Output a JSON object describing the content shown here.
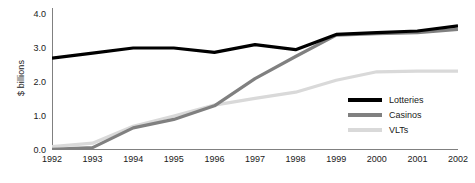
{
  "chart_data": {
    "type": "line",
    "title": "",
    "xlabel": "",
    "ylabel": "$ billions",
    "categories": [
      "1992",
      "1993",
      "1994",
      "1995",
      "1996",
      "1997",
      "1998",
      "1999",
      "2000",
      "2001",
      "2002"
    ],
    "x": [
      1992,
      1993,
      1994,
      1995,
      1996,
      1997,
      1998,
      1999,
      2000,
      2001,
      2002
    ],
    "xlim": [
      1992,
      2002
    ],
    "ylim": [
      0.0,
      4.0
    ],
    "yticks": [
      0.0,
      1.0,
      2.0,
      3.0,
      4.0
    ],
    "ytick_labels": [
      "0.0",
      "1.0",
      "2.0",
      "3.0",
      "4.0"
    ],
    "grid": false,
    "legend_position": "lower-right",
    "series": [
      {
        "name": "Lotteries",
        "color": "#000000",
        "width": 3.2,
        "values": [
          2.7,
          2.85,
          3.0,
          3.0,
          2.87,
          3.1,
          2.95,
          3.4,
          3.45,
          3.5,
          3.65
        ]
      },
      {
        "name": "Casinos",
        "color": "#808080",
        "width": 3.2,
        "values": [
          0.02,
          0.07,
          0.65,
          0.9,
          1.3,
          2.1,
          2.75,
          3.38,
          3.42,
          3.45,
          3.55
        ]
      },
      {
        "name": "VLTs",
        "color": "#d9d9d9",
        "width": 3.2,
        "values": [
          0.1,
          0.2,
          0.7,
          1.0,
          1.32,
          1.52,
          1.7,
          2.05,
          2.3,
          2.32,
          2.32
        ]
      }
    ]
  },
  "axis": {
    "line_color": "#808080",
    "tick_color": "#808080"
  },
  "legend": {
    "entries": [
      {
        "label": "Lotteries",
        "color": "#000000"
      },
      {
        "label": "Casinos",
        "color": "#808080"
      },
      {
        "label": "VLTs",
        "color": "#d9d9d9"
      }
    ]
  }
}
